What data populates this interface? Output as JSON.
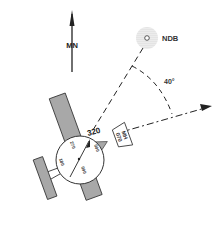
{
  "diagram": {
    "type": "ndb-relative-bearing",
    "labels": {
      "magnetic_north": "MN",
      "ndb": "NDB",
      "angle": "40°",
      "heading_box_line1": "MH",
      "heading_box_line2": "070"
    },
    "compass_card": {
      "top": "320",
      "left_upper": "270",
      "left_lower": "180",
      "right_upper": "000",
      "bottom": "090"
    },
    "colors": {
      "aircraft_fill": "#a8a8a8",
      "line": "#222222",
      "ndb_halo": "#bdbdbd",
      "background": "#ffffff"
    }
  }
}
